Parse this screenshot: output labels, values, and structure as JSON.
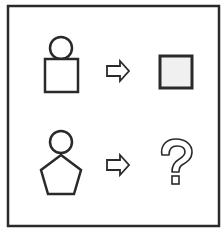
{
  "puzzle": {
    "type": "analogy",
    "rows": [
      {
        "left": {
          "top_shape": "circle",
          "bottom_shape": "square"
        },
        "arrow": "hollow-right-arrow",
        "right": {
          "shape": "square",
          "fill": "#f0f0f0"
        }
      },
      {
        "left": {
          "top_shape": "circle",
          "bottom_shape": "pentagon"
        },
        "arrow": "hollow-right-arrow",
        "right": {
          "shape": "question-mark",
          "label": "?"
        }
      }
    ]
  },
  "colors": {
    "stroke": "#2a2a2a",
    "background": "#ffffff",
    "square_fill": "#f0f0f0"
  }
}
